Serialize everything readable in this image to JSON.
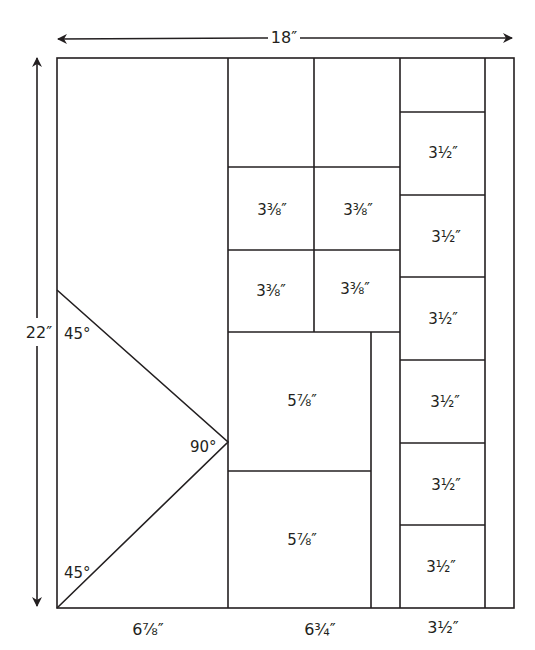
{
  "diagram": {
    "type": "quilt-layout",
    "overall": {
      "width_label": "18″",
      "height_label": "22″"
    },
    "bottom_labels": {
      "left": "6⅞″",
      "middle": "6¾″",
      "right": "3½″"
    },
    "angles": {
      "top": "45°",
      "apex": "90°",
      "bottom": "45°"
    },
    "small_squares": [
      "3⅜″",
      "3⅜″",
      "3⅜″",
      "3⅜″"
    ],
    "large_squares": [
      "5⅞″",
      "5⅞″"
    ],
    "column_squares": [
      "3½″",
      "3½″",
      "3½″",
      "3½″",
      "3½″",
      "3½″"
    ],
    "line_color": "#231f20"
  }
}
